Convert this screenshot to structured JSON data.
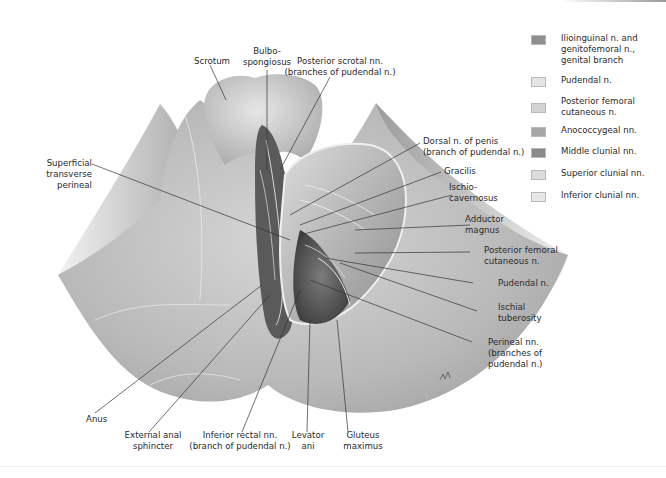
{
  "labels": {
    "scrotum": "Scrotum",
    "bulbospongiosus": "Bulbo-\nspongiosus",
    "posterior_scrotal": "Posterior scrotal nn.\n(branches of pudendal n.)",
    "superficial_transverse": "Superficial\ntransverse\nperineal",
    "dorsal_penis": "Dorsal n. of penis\n(branch of pudendal n.)",
    "gracilis": "Gracilis",
    "ischiocavernosus": "Ischio-\ncavernosus",
    "adductor_magnus": "Adductor\nmagnus",
    "posterior_femoral_cutaneous": "Posterior femoral\ncutaneous n.",
    "pudendal": "Pudendal n.",
    "ischial_tuberosity": "Ischial\ntuberosity",
    "perineal_nn": "Perineal nn.\n(branches of\npudendal n.)",
    "anus": "Anus",
    "external_anal_sphincter": "External anal\nsphincter",
    "inferior_rectal": "Inferior rectal nn.\n(branch of pudendal n.)",
    "levator_ani": "Levator\nani",
    "gluteus_maximus": "Gluteus\nmaximus"
  },
  "legend": {
    "items": [
      {
        "label": "Ilioinguinal n. and\ngenitofemoral n.,\ngenital branch",
        "color": "#8f8f8f"
      },
      {
        "label": "Pudendal n.",
        "color": "#e4e4e4"
      },
      {
        "label": "Posterior femoral\ncutaneous n.",
        "color": "#d2d2d2"
      },
      {
        "label": "Anococcygeal nn.",
        "color": "#a6a6a6"
      },
      {
        "label": "Middle clunial nn.",
        "color": "#8a8a8a"
      },
      {
        "label": "Superior clunial nn.",
        "color": "#dcdcdc"
      },
      {
        "label": "Inferior clunial nn.",
        "color": "#e8e8e8"
      }
    ]
  }
}
